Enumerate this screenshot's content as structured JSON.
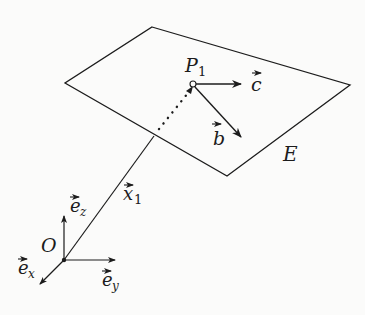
{
  "diagram": {
    "plane": {
      "label": "E"
    },
    "point": {
      "label": "P",
      "subscript": "1"
    },
    "vectors": {
      "c": {
        "label": "c"
      },
      "b": {
        "label": "b"
      },
      "x1": {
        "label": "x",
        "subscript": "1"
      }
    },
    "origin": {
      "label": "O"
    },
    "axes": {
      "ex": {
        "label": "e",
        "subscript": "x"
      },
      "ey": {
        "label": "e",
        "subscript": "y"
      },
      "ez": {
        "label": "e",
        "subscript": "z"
      }
    },
    "colors": {
      "stroke": "#1c1c1c",
      "background": "#fbfbfa"
    }
  }
}
